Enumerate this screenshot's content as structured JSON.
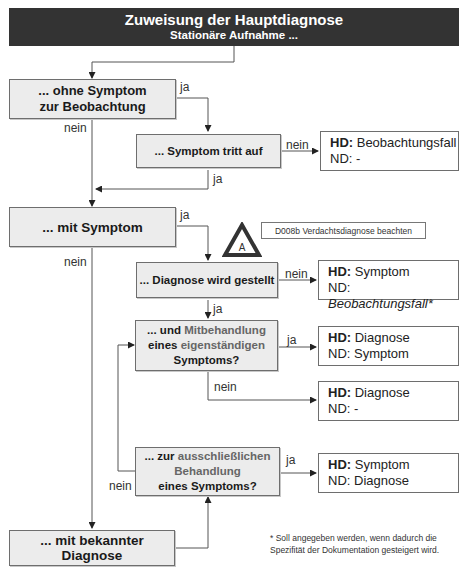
{
  "header": {
    "title": "Zuweisung der Hauptdiagnose",
    "subtitle": "Stationäre Aufnahme ..."
  },
  "decisions": {
    "ohne_symptom": {
      "line1": "... ohne Symptom",
      "line2": "zur Beobachtung"
    },
    "symptom_tritt_auf": {
      "label": "... Symptom tritt auf"
    },
    "mit_symptom": {
      "label": "... mit Symptom"
    },
    "diagnose_gestellt": {
      "label": "... Diagnose wird gestellt"
    },
    "mitbehandlung": {
      "prefix": "... und ",
      "highlight1": "Mitbehandlung",
      "line2a": "eines ",
      "highlight2": "eigenständigen",
      "line3": "Symptoms?"
    },
    "ausschliesslich": {
      "prefix": "... zur ",
      "highlight1": "ausschließlichen",
      "highlight2": "Behandlung",
      "line3": "eines Symptoms?"
    },
    "bekannte_diagnose": {
      "label": "... mit bekannter Diagnose"
    }
  },
  "results": [
    {
      "hd_label": "HD:",
      "hd_value": " Beobachtungsfall",
      "nd_label": "ND:",
      "nd_value": " -"
    },
    {
      "hd_label": "HD:",
      "hd_value": " Symptom",
      "nd_label": "ND:",
      "nd_value": "Beobachtungsfall*"
    },
    {
      "hd_label": "HD:",
      "hd_value": " Diagnose",
      "nd_label": "ND:",
      "nd_value": " Symptom"
    },
    {
      "hd_label": "HD:",
      "hd_value": " Diagnose",
      "nd_label": "ND:",
      "nd_value": " -"
    },
    {
      "hd_label": "HD:",
      "hd_value": " Symptom",
      "nd_label": "ND:",
      "nd_value": " Diagnose"
    }
  ],
  "edge_labels": {
    "ja": "ja",
    "nein": "nein"
  },
  "warning": {
    "icon_letter": "A",
    "note": "D008b Verdachtsdiagnose beachten"
  },
  "footnote": {
    "line1": "* Soll angegeben werden, wenn dadurch die",
    "line2": "Spezifität der Dokumentation gesteigert wird."
  }
}
